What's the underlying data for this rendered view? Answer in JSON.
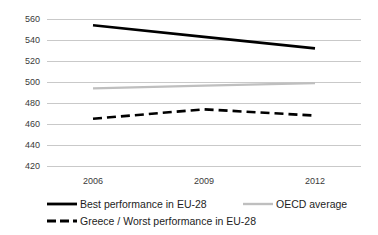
{
  "chart_data": {
    "type": "line",
    "title": "",
    "subtitle": "",
    "xlabel": "",
    "ylabel": "",
    "x": [
      2006,
      2009,
      2012
    ],
    "categories": [
      "2006",
      "2009",
      "2012"
    ],
    "xtick_labels": [
      "2006",
      "2009",
      "2012"
    ],
    "ytick_labels": [
      "560",
      "540",
      "520",
      "500",
      "480",
      "460",
      "440",
      "420"
    ],
    "yticks": [
      560,
      540,
      520,
      500,
      480,
      460,
      440,
      420
    ],
    "ylim": [
      420,
      560
    ],
    "grid": "horizontal",
    "legend_position": "bottom",
    "series": [
      {
        "name": "Best performance in EU-28",
        "values": [
          554,
          543,
          532
        ],
        "color": "#000000",
        "style": "solid",
        "width": 2.6
      },
      {
        "name": "OECD average",
        "values": [
          494,
          496.5,
          499
        ],
        "color": "#bfbfbf",
        "style": "solid",
        "width": 2.2
      },
      {
        "name": "Greece / Worst performance in EU-28",
        "values": [
          465,
          474,
          468
        ],
        "color": "#000000",
        "style": "dashed",
        "width": 2.6
      }
    ]
  },
  "axis": {
    "y_labels": [
      "560",
      "540",
      "520",
      "500",
      "480",
      "460",
      "440",
      "420"
    ],
    "x_labels": [
      "2006",
      "2009",
      "2012"
    ]
  },
  "legend": {
    "entries": [
      {
        "label": "Best performance in EU-28",
        "color": "#000000",
        "style": "solid"
      },
      {
        "label": "OECD average",
        "color": "#bfbfbf",
        "style": "solid"
      },
      {
        "label": "Greece / Worst performance in EU-28",
        "color": "#000000",
        "style": "dashed"
      }
    ]
  },
  "colors": {
    "gridline": "#c9c9c9",
    "best": "#000000",
    "oecd": "#bfbfbf",
    "greece": "#000000",
    "tick_text": "#3a3a3a",
    "legend_text": "#1d1d1d",
    "background": "#ffffff"
  }
}
